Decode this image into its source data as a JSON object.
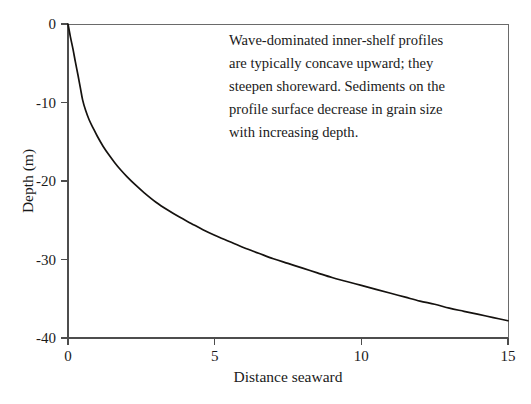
{
  "chart_data": {
    "type": "line",
    "title": "",
    "subtitle": "",
    "xlabel": "Distance seaward",
    "ylabel": "Depth (m)",
    "xlim": [
      0,
      15
    ],
    "ylim": [
      -40,
      0
    ],
    "xticks": [
      0,
      5,
      10,
      15
    ],
    "xtick_labels": [
      "0",
      "5",
      "10",
      "15"
    ],
    "yticks": [
      0,
      -10,
      -20,
      -30,
      -40
    ],
    "ytick_labels": [
      "0",
      "-10",
      "-20",
      "-30",
      "-40"
    ],
    "grid": false,
    "legend": null,
    "legend_position": "none",
    "series": [
      {
        "name": "Inner-shelf equilibrium profile",
        "color": "#15120f",
        "line_width": 1.7,
        "x": [
          0.0,
          0.08,
          0.17,
          0.25,
          0.34,
          0.42,
          0.5,
          0.6,
          0.72,
          0.85,
          1.0,
          1.2,
          1.4,
          1.6,
          1.8,
          2.0,
          2.3,
          2.6,
          3.0,
          3.4,
          3.8,
          4.2,
          4.6,
          5.0,
          5.5,
          6.0,
          6.5,
          7.0,
          7.5,
          8.0,
          8.5,
          9.0,
          9.5,
          10.0,
          10.5,
          11.0,
          11.5,
          12.0,
          12.5,
          13.0,
          13.5,
          14.0,
          14.5,
          15.0
        ],
        "y": [
          0.0,
          -1.6,
          -3.2,
          -4.8,
          -6.5,
          -8.1,
          -9.7,
          -11.0,
          -12.2,
          -13.2,
          -14.3,
          -15.6,
          -16.7,
          -17.7,
          -18.6,
          -19.4,
          -20.5,
          -21.5,
          -22.7,
          -23.7,
          -24.6,
          -25.4,
          -26.2,
          -26.9,
          -27.7,
          -28.5,
          -29.2,
          -29.9,
          -30.5,
          -31.1,
          -31.7,
          -32.3,
          -32.8,
          -33.3,
          -33.8,
          -34.3,
          -34.8,
          -35.3,
          -35.7,
          -36.2,
          -36.6,
          -37.0,
          -37.4,
          -37.8
        ]
      }
    ],
    "annotations": [
      {
        "name": "profile-description",
        "lines": [
          "Wave-dominated inner-shelf profiles",
          "are typically concave upward; they",
          "steepen shoreward. Sediments on the",
          "profile surface decrease in grain size",
          "with increasing depth."
        ],
        "x": 2.1,
        "y": -3.5
      }
    ]
  },
  "axes": {
    "ylabel": "Depth (m)",
    "xlabel": "Distance seaward"
  },
  "colors": {
    "curve": "#15120f",
    "axis": "#4d4d4d",
    "frame": "#6a6a6a",
    "background": "#ffffff",
    "text": "#1a1a1a"
  }
}
